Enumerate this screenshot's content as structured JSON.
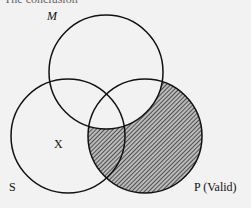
{
  "top_text": "The conclusion",
  "labels": {
    "m": "M",
    "s": "S",
    "x": "X",
    "p": "P",
    "p_suffix": "(Valid)"
  },
  "colors": {
    "stroke": "#111111",
    "hatch": "#333333",
    "background": "#f2f2f2"
  }
}
